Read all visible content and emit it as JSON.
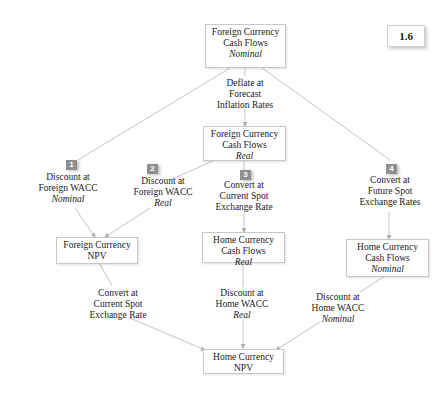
{
  "figure_label": "1.6",
  "nodes": {
    "fc_nominal": {
      "line1": "Foreign Currency",
      "line2": "Cash Flows",
      "line3": "Nominal"
    },
    "fc_real": {
      "line1": "Foreign Currency",
      "line2": "Cash Flows",
      "line3": "Real"
    },
    "fc_npv": {
      "line1": "Foreign Currency",
      "line2": "NPV"
    },
    "hc_real": {
      "line1": "Home Currency",
      "line2": "Cash Flows",
      "line3": "Real"
    },
    "hc_nominal": {
      "line1": "Home Currency",
      "line2": "Cash Flows",
      "line3": "Nominal"
    },
    "hc_npv": {
      "line1": "Home Currency",
      "line2": "NPV"
    }
  },
  "edges": {
    "deflate": {
      "line1": "Deflate at",
      "line2": "Forecast",
      "line3": "Inflation Rates"
    },
    "path1": {
      "number": "1",
      "line1": "Discount at",
      "line2": "Foreign WACC",
      "line3": "Nominal"
    },
    "path2": {
      "number": "2",
      "line1": "Discount at",
      "line2": "Foreign WACC",
      "line3": "Real"
    },
    "path3": {
      "number": "3",
      "line1": "Convert at",
      "line2": "Current Spot",
      "line3": "Exchange Rate"
    },
    "path4": {
      "number": "4",
      "line1": "Convert at",
      "line2": "Future Spot",
      "line3": "Exchange Rates"
    },
    "convert_spot": {
      "line1": "Convert at",
      "line2": "Current Spot",
      "line3": "Exchange Rate"
    },
    "home_real": {
      "line1": "Discount at",
      "line2": "Home WACC",
      "line3": "Real"
    },
    "home_nominal": {
      "line1": "Discount at",
      "line2": "Home WACC",
      "line3": "Nominal"
    }
  },
  "colors": {
    "line": "#c4c4c4",
    "badge": "#8f8f8f",
    "box_border": "#c8c8c8"
  }
}
